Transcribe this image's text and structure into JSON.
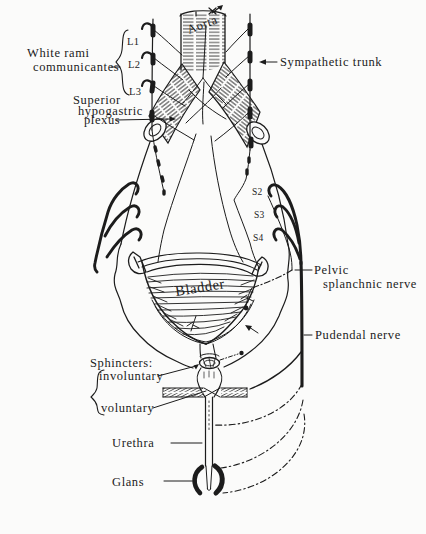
{
  "figure": {
    "type": "anatomical line diagram",
    "ink_color": "#1c1c1c",
    "background_color": "#fbfbfa"
  },
  "labels": {
    "white_rami": {
      "line1": "White rami",
      "line2": "communicantes"
    },
    "aorta": "Aorta",
    "sympathetic_trunk": "Sympathetic trunk",
    "superior_hypogastric": {
      "line1": "Superior",
      "line2": "hypogastric",
      "line3": "plexus"
    },
    "lumbar": {
      "l1": "L1",
      "l2": "L2",
      "l3": "L3"
    },
    "sacral": {
      "s2": "S2",
      "s3": "S3",
      "s4": "S4"
    },
    "bladder": "Bladder",
    "pelvic_splanchnic": {
      "line1": "Pelvic",
      "line2": "splanchnic nerve"
    },
    "pudendal": "Pudendal nerve",
    "sphincters": {
      "heading": "Sphincters:",
      "involuntary": "involuntary",
      "voluntary": "voluntary"
    },
    "urethra": "Urethra",
    "glans": "Glans"
  }
}
